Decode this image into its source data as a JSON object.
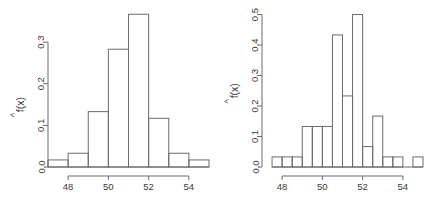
{
  "figure": {
    "title": "",
    "background": "#ffffff",
    "line_color": "#6b6b6b",
    "text_color": "#3a3a3a",
    "panel_count": 2
  },
  "chart_data": [
    {
      "type": "bar",
      "subtype": "histogram-density",
      "panel": "left",
      "title": "",
      "xlabel": "",
      "ylabel": "f^(x)",
      "ylabel_parts": {
        "hat": "^",
        "base": "f(x)"
      },
      "xlim": [
        47.0,
        55.0
      ],
      "ylim": [
        0.0,
        0.37
      ],
      "grid": false,
      "legend": null,
      "binwidth": 1.0,
      "xticks": [
        48,
        50,
        52,
        54
      ],
      "xticklabels": [
        "48",
        "50",
        "52",
        "54"
      ],
      "yticks": [
        0.0,
        0.1,
        0.2,
        0.3
      ],
      "yticklabels": [
        "0.0",
        "0.1",
        "0.2",
        "0.3"
      ],
      "bin_edges": [
        47.0,
        48.0,
        49.0,
        50.0,
        51.0,
        52.0,
        53.0,
        54.0,
        55.0
      ],
      "categories": [
        "47-48",
        "48-49",
        "49-50",
        "50-51",
        "51-52",
        "52-53",
        "53-54",
        "54-55"
      ],
      "values": [
        0.017,
        0.033,
        0.133,
        0.283,
        0.367,
        0.117,
        0.033,
        0.017
      ]
    },
    {
      "type": "bar",
      "subtype": "histogram-density",
      "panel": "right",
      "title": "",
      "xlabel": "",
      "ylabel": "f^(x)",
      "ylabel_parts": {
        "hat": "^",
        "base": "f(x)"
      },
      "xlim": [
        47.0,
        55.0
      ],
      "ylim": [
        0.0,
        0.505
      ],
      "grid": false,
      "legend": null,
      "binwidth": 0.5,
      "xticks": [
        48,
        50,
        52,
        54
      ],
      "xticklabels": [
        "48",
        "50",
        "52",
        "54"
      ],
      "yticks": [
        0.0,
        0.1,
        0.2,
        0.3,
        0.4,
        0.5
      ],
      "yticklabels": [
        "0.0",
        "0.1",
        "0.2",
        "0.3",
        "0.4",
        "0.5"
      ],
      "bin_edges": [
        47.5,
        48.0,
        48.5,
        49.0,
        49.5,
        50.0,
        50.5,
        51.0,
        51.5,
        52.0,
        52.5,
        53.0,
        53.5,
        54.0,
        54.5,
        55.0
      ],
      "categories": [
        "47.5-48",
        "48-48.5",
        "48.5-49",
        "49-49.5",
        "49.5-50",
        "50-50.5",
        "50.5-51",
        "51-51.5",
        "51.5-52",
        "52-52.5",
        "52.5-53",
        "53-53.5",
        "53.5-54",
        "54-54.5",
        "54.5-55"
      ],
      "values": [
        0.033,
        0.033,
        0.033,
        0.133,
        0.133,
        0.133,
        0.433,
        0.233,
        0.5,
        0.067,
        0.167,
        0.033,
        0.033,
        0.0,
        0.033
      ]
    }
  ]
}
